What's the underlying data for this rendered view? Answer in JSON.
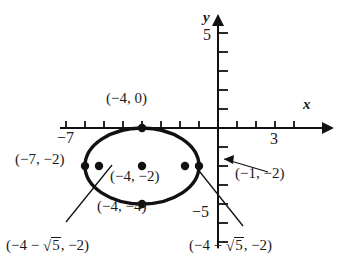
{
  "figure": {
    "type": "analytic-geometry-graph",
    "stroke_color": "#111111",
    "background": "#ffffff"
  },
  "axes": {
    "x_axis_name": "x",
    "y_axis_name": "y",
    "origin_px": {
      "x": 218,
      "y": 128
    },
    "unit_px": 19,
    "x_range": [
      -8.4,
      5.2
    ],
    "y_range": [
      -6.2,
      6.0
    ],
    "x_tick_labels": [
      {
        "text": "−7",
        "value": -7
      },
      {
        "text": "3",
        "value": 3
      }
    ],
    "y_tick_labels": [
      {
        "text": "5",
        "value": 5
      },
      {
        "text": "−5",
        "value": -5
      }
    ],
    "x_ticks": [
      -8,
      -7,
      -6,
      -5,
      -4,
      -3,
      -2,
      -1,
      1,
      2,
      3,
      4
    ],
    "y_ticks": [
      5,
      4,
      3,
      2,
      1,
      -1,
      -2,
      -3,
      -4,
      -5,
      -6
    ]
  },
  "conic": {
    "shape": "ellipse",
    "center": {
      "x": -4,
      "y": -2,
      "label": "(−4, −2)"
    },
    "semi_major_a": 3,
    "semi_minor_b": 2,
    "orientation": "horizontal"
  },
  "labels": {
    "top_vertex": "(−4, 0)",
    "bottom_vertex": "(−4, −4)",
    "left_vertex": "(−7, −2)",
    "right_vertex": "(−1, −2)",
    "center": "(−4, −2)",
    "focus_left_open": "(−4 − ",
    "focus_left_close": ", −2)",
    "focus_right_open": "(−4 + ",
    "focus_right_close": ", −2)",
    "radicand": "5",
    "radical_symbol": "√"
  },
  "points": [
    {
      "name": "top-vertex",
      "x": -4,
      "y": 0
    },
    {
      "name": "bottom-vertex",
      "x": -4,
      "y": -4
    },
    {
      "name": "left-vertex",
      "x": -7,
      "y": -2
    },
    {
      "name": "right-vertex",
      "x": -1,
      "y": -2
    },
    {
      "name": "center",
      "x": -4,
      "y": -2
    },
    {
      "name": "left-focus",
      "x": -6.236,
      "y": -2
    },
    {
      "name": "right-focus",
      "x": -1.764,
      "y": -2
    }
  ],
  "leaders": [
    {
      "name": "leader-right-vertex",
      "from": [
        268,
        172
      ],
      "to": [
        222,
        158
      ]
    },
    {
      "name": "leader-left-focus",
      "from": [
        66,
        222
      ],
      "to": [
        110,
        166
      ]
    },
    {
      "name": "leader-right-focus",
      "from": [
        243,
        226
      ],
      "to": [
        197,
        168
      ]
    }
  ]
}
